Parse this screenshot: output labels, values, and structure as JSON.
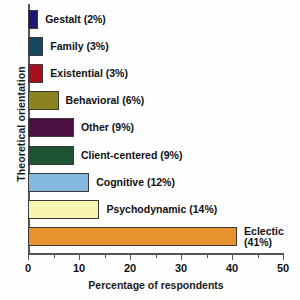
{
  "chart_data": {
    "type": "bar",
    "orientation": "horizontal",
    "title": "",
    "xlabel": "Percentage of respondents",
    "ylabel": "Theoretical orientation",
    "xlim": [
      0,
      50
    ],
    "xticks": [
      0,
      10,
      20,
      30,
      40,
      50
    ],
    "xtick_labels": [
      "0",
      "10",
      "20",
      "30",
      "40",
      "50"
    ],
    "minor_xticks": [
      5,
      15,
      25,
      35,
      45
    ],
    "grid": false,
    "legend": "none",
    "categories": [
      "Gestalt",
      "Family",
      "Existential",
      "Behavioral",
      "Other",
      "Client-centered",
      "Cognitive",
      "Psychodynamic",
      "Eclectic"
    ],
    "values": [
      2,
      3,
      3,
      6,
      9,
      9,
      12,
      14,
      41
    ],
    "bars": [
      {
        "label": "Gestalt",
        "value": 2,
        "text": "Gestalt (2%)",
        "color": "#191970",
        "wrap": false
      },
      {
        "label": "Family",
        "value": 3,
        "text": "Family (3%)",
        "color": "#15485e",
        "wrap": false
      },
      {
        "label": "Existential",
        "value": 3,
        "text": "Existential (3%)",
        "color": "#a3101b",
        "wrap": false
      },
      {
        "label": "Behavioral",
        "value": 6,
        "text": "Behavioral (6%)",
        "color": "#8b8322",
        "wrap": false
      },
      {
        "label": "Other",
        "value": 9,
        "text": "Other (9%)",
        "color": "#4a1142",
        "wrap": false
      },
      {
        "label": "Client-centered",
        "value": 9,
        "text": "Client-centered (9%)",
        "color": "#1d5233",
        "wrap": false
      },
      {
        "label": "Cognitive",
        "value": 12,
        "text": "Cognitive (12%)",
        "color": "#84b8dd",
        "wrap": false
      },
      {
        "label": "Psychodynamic",
        "value": 14,
        "text": "Psychodynamic (14%)",
        "color": "#f8f5b0",
        "wrap": false
      },
      {
        "label": "Eclectic",
        "value": 41,
        "text": "Eclectic (41%)",
        "color": "#e8912f",
        "wrap": true
      }
    ]
  }
}
